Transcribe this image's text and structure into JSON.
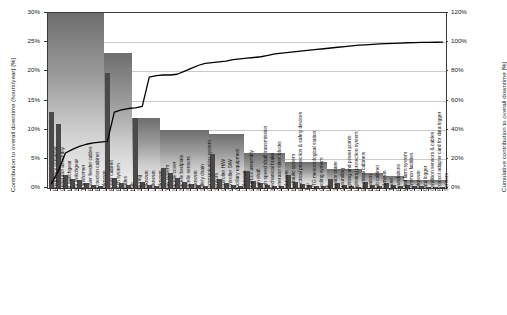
{
  "chart_data": {
    "type": "bar",
    "title": "",
    "xlabel": "",
    "ylabel": "Contribution to overall downtime (hours/year) [%]",
    "y2label": "Cumulative contribution to overall downtime [%]",
    "ylim": [
      0,
      30
    ],
    "y2lim": [
      0,
      120
    ],
    "grid": true,
    "legend": "none",
    "yticks": [
      "0%",
      "5%",
      "10%",
      "15%",
      "20%",
      "25%",
      "30%"
    ],
    "ytick_values": [
      0,
      5,
      10,
      15,
      20,
      25,
      30
    ],
    "y2ticks": [
      "0%",
      "20%",
      "40%",
      "60%",
      "80%",
      "100%",
      "120%"
    ],
    "y2tick_values": [
      0,
      20,
      40,
      60,
      80,
      100,
      120
    ],
    "categories": [
      "Frequency converter",
      "Generator assembly",
      "LV switchgear",
      "MV switchgear",
      "Transformer",
      "Power feeder cables",
      "Protection cabinet",
      "Unknown",
      "Power cabinet",
      "Pitch system",
      "Blades",
      "Hub",
      "Slipring",
      "Unknown",
      "Unknown",
      "Unknown",
      "Yaw system",
      "Nacelle cover",
      "Nacelle bedplate",
      "Nacelle sensors",
      "Unknown",
      "Safety chain",
      "Communication system",
      "Sensors",
      "Controller H/W",
      "Controller S/W",
      "Ancillary equipment",
      "Unknown",
      "Gearbox assembly",
      "Main shaft",
      "High speed shaft transmission",
      "Mechanical brake",
      "Generator silent blocks",
      "Unknown",
      "Hydraulic system",
      "Electrical protection & safety devices",
      "Top",
      "WTG meteorological station",
      "Cooling system",
      "Lift",
      "Service crane",
      "Grounding",
      "Lighting and power points",
      "Lightning protection system",
      "Electrical cabinets",
      "Beacon",
      "Hub cabinet",
      "Unknown",
      "Tower",
      "Foundations",
      "Wind farm system",
      "Common facilities",
      "Unknown",
      "Data logger",
      "Condition sensors & cables",
      "Protocol adapter card for data logger",
      "Sensors"
    ],
    "values": [
      13.0,
      11.0,
      2.2,
      1.6,
      1.4,
      0.9,
      0.6,
      0.4,
      19.7,
      1.8,
      0.8,
      0.6,
      12.0,
      1.1,
      0.6,
      0.4,
      3.4,
      2.6,
      1.8,
      1.1,
      0.7,
      0.5,
      0.4,
      5.8,
      1.6,
      0.9,
      0.6,
      0.4,
      3.0,
      1.2,
      0.8,
      0.5,
      0.4,
      0.3,
      2.2,
      1.0,
      0.7,
      0.5,
      0.4,
      0.3,
      1.6,
      0.8,
      0.5,
      0.3,
      0.2,
      1.1,
      0.5,
      0.3,
      0.9,
      0.5,
      0.3,
      0.6,
      0.4,
      0.3,
      0.2,
      0.15,
      0.1
    ],
    "group_blocks": [
      {
        "name": "Electrical system",
        "start": 0,
        "end": 7,
        "height": 30.0
      },
      {
        "name": "Rotor / pitch",
        "start": 8,
        "end": 11,
        "height": 23.2
      },
      {
        "name": "Nacelle / slipring",
        "start": 12,
        "end": 15,
        "height": 12.0
      },
      {
        "name": "Yaw & nacelle",
        "start": 16,
        "end": 22,
        "height": 10.0
      },
      {
        "name": "Control system",
        "start": 23,
        "end": 27,
        "height": 9.3
      },
      {
        "name": "Drive train",
        "start": 28,
        "end": 33,
        "height": 6.0
      },
      {
        "name": "Auxiliary systems",
        "start": 34,
        "end": 39,
        "height": 4.4
      },
      {
        "name": "Tower internals",
        "start": 40,
        "end": 44,
        "height": 3.3
      },
      {
        "name": "Structure",
        "start": 45,
        "end": 47,
        "height": 2.6
      },
      {
        "name": "Foundations / farm",
        "start": 48,
        "end": 50,
        "height": 2.0
      },
      {
        "name": "Monitoring",
        "start": 51,
        "end": 56,
        "height": 1.4
      }
    ],
    "cumulative": [
      3.0,
      12.0,
      24.0,
      26.5,
      28.5,
      30.0,
      31.0,
      31.5,
      32.0,
      52.0,
      53.5,
      54.5,
      55.0,
      56.0,
      76.0,
      77.0,
      77.5,
      77.5,
      78.0,
      80.0,
      82.0,
      84.0,
      85.5,
      86.0,
      86.5,
      87.0,
      88.0,
      88.5,
      89.0,
      89.5,
      90.0,
      91.0,
      92.0,
      92.5,
      93.0,
      93.5,
      94.0,
      94.5,
      95.0,
      95.5,
      96.0,
      96.5,
      97.0,
      97.5,
      98.0,
      98.2,
      98.5,
      98.8,
      99.0,
      99.2,
      99.4,
      99.6,
      99.7,
      99.8,
      99.9,
      99.95,
      100.0
    ]
  },
  "axes": {
    "left_title": "Contribution to overall downtime (hours/year) [%]",
    "right_title": "Cumulative contribution to overall downtime [%]"
  },
  "colors": {
    "bar": "#4a4a4a",
    "block_top": "#6e6e6e",
    "block_bottom": "#f2f2f2",
    "line": "#000000",
    "grid": "#c9c9c9",
    "axis": "#3a3a3a",
    "text": "#141414"
  }
}
